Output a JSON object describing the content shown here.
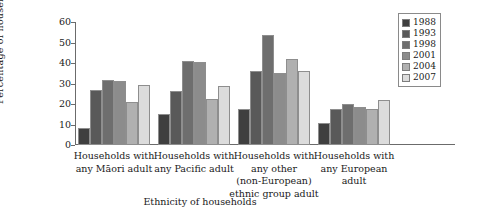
{
  "chart_data": {
    "type": "bar",
    "title": "",
    "xlabel": "Ethnicity of households",
    "ylabel": "Percentage of households",
    "ylim": [
      0,
      60
    ],
    "yticks": [
      0,
      10,
      20,
      30,
      40,
      50,
      60
    ],
    "grid": false,
    "legend_position": "top-right",
    "categories": [
      [
        "Households with",
        "any Māori adult"
      ],
      [
        "Households with",
        "any Pacific adult"
      ],
      [
        "Households with",
        "any other",
        "(non-European)",
        "ethnic group adult"
      ],
      [
        "Households with",
        "any European",
        "adult"
      ]
    ],
    "category_names": [
      "Households with any Māori adult",
      "Households with any Pacific adult",
      "Households with any other (non-European) ethnic group adult",
      "Households with any European adult"
    ],
    "series": [
      {
        "name": "1988",
        "color": "#3f3f3f",
        "values": [
          8.5,
          15.0,
          17.5,
          10.5
        ]
      },
      {
        "name": "1993",
        "color": "#595959",
        "values": [
          27.0,
          26.5,
          36.0,
          17.5
        ]
      },
      {
        "name": "1998",
        "color": "#6e6e6e",
        "values": [
          31.5,
          41.0,
          53.5,
          20.0
        ]
      },
      {
        "name": "2001",
        "color": "#8c8c8c",
        "values": [
          31.0,
          40.5,
          35.0,
          18.5
        ]
      },
      {
        "name": "2004",
        "color": "#b0b0b0",
        "values": [
          21.0,
          22.5,
          42.0,
          17.5
        ]
      },
      {
        "name": "2007",
        "color": "#dcdcdc",
        "values": [
          29.5,
          29.0,
          36.0,
          22.0
        ]
      }
    ]
  }
}
